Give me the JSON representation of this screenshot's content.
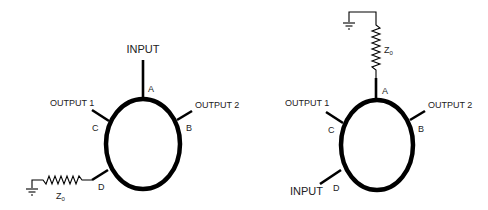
{
  "diagrams": [
    {
      "name": "left",
      "port_labels": {
        "a": "A",
        "b": "B",
        "c": "C",
        "d": "D"
      },
      "input_label": "INPUT",
      "output1_label": "OUTPUT 1",
      "output2_label": "OUTPUT 2",
      "termination": {
        "label": "Z",
        "subscript": "0",
        "port": "D"
      }
    },
    {
      "name": "right",
      "port_labels": {
        "a": "A",
        "b": "B",
        "c": "C",
        "d": "D"
      },
      "input_label": "INPUT",
      "output1_label": "OUTPUT 1",
      "output2_label": "OUTPUT 2",
      "termination": {
        "label": "Z",
        "subscript": "0",
        "port": "A"
      }
    }
  ]
}
